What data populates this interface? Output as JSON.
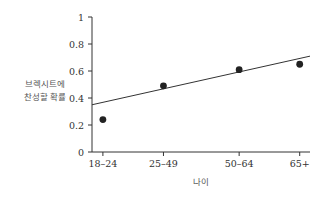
{
  "chart_data": {
    "type": "scatter",
    "title": "",
    "xlabel": "나이",
    "ylabel_lines": [
      "브렉시트에",
      "찬성할 확률"
    ],
    "categories": [
      "18-24",
      "25-49",
      "50-64",
      "65+"
    ],
    "x_positions": [
      0,
      1,
      2.25,
      3.25
    ],
    "values": [
      0.24,
      0.49,
      0.61,
      0.65
    ],
    "ylim": [
      0,
      1
    ],
    "yticks": [
      0,
      0.2,
      0.4,
      0.6,
      0.8,
      1
    ],
    "ytick_labels": [
      "0",
      "0.2",
      "0.4",
      "0.6",
      "0.8",
      "1"
    ],
    "xlim": [
      -0.18,
      3.42
    ],
    "fit_line": {
      "x": [
        -0.18,
        3.42
      ],
      "y": [
        0.35,
        0.71
      ]
    },
    "grid": false,
    "legend": "none",
    "colors": {
      "axis": "#333333",
      "point": "#222222",
      "line": "#333333"
    }
  }
}
